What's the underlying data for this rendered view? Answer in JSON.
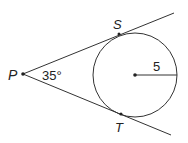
{
  "diagram": {
    "points": {
      "P": {
        "label": "P",
        "x": 23,
        "y": 74
      },
      "S": {
        "label": "S",
        "x": 119,
        "y": 34
      },
      "T": {
        "label": "T",
        "x": 121,
        "y": 114
      },
      "center": {
        "x": 135,
        "y": 75
      }
    },
    "circle": {
      "radius_px": 42,
      "radius_label": "5"
    },
    "angle": {
      "label": "35°",
      "value": "35",
      "unit": "°"
    },
    "stroke_color": "#333333"
  }
}
